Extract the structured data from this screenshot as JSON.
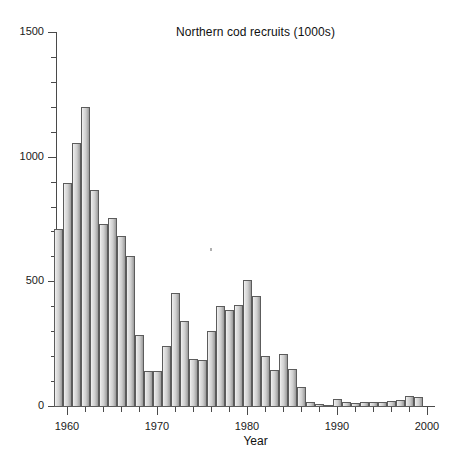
{
  "chart_data": {
    "type": "bar",
    "title": "Northern cod recruits (1000s)",
    "xlabel": "Year",
    "ylabel": "",
    "xlim": [
      1958.5,
      2000.5
    ],
    "ylim": [
      0,
      1500
    ],
    "grid": false,
    "legend": null,
    "y_ticks": [
      0,
      500,
      1000,
      1500
    ],
    "y_tick_labels": [
      "0",
      "500",
      "1000",
      "1500"
    ],
    "y_minor_tick_interval": 100,
    "x_ticks": [
      1960,
      1970,
      1980,
      1990,
      2000
    ],
    "x_tick_labels": [
      "1960",
      "1970",
      "1980",
      "1990",
      "2000"
    ],
    "x_minor_tick_interval": 2,
    "bar_color": "#cfcfcf",
    "bar_edge_color": "#5c5c5c",
    "categories": [
      1959,
      1960,
      1961,
      1962,
      1963,
      1964,
      1965,
      1966,
      1967,
      1968,
      1969,
      1970,
      1971,
      1972,
      1973,
      1974,
      1975,
      1976,
      1977,
      1978,
      1979,
      1980,
      1981,
      1982,
      1983,
      1984,
      1985,
      1986,
      1987,
      1988,
      1989,
      1990,
      1991,
      1992,
      1993,
      1994,
      1995,
      1996,
      1997,
      1998,
      1999
    ],
    "values": [
      710,
      895,
      1055,
      1200,
      865,
      730,
      755,
      680,
      600,
      285,
      140,
      140,
      240,
      455,
      340,
      190,
      185,
      300,
      400,
      385,
      405,
      505,
      440,
      200,
      145,
      210,
      150,
      75,
      15,
      8,
      5,
      30,
      15,
      12,
      15,
      18,
      15,
      20,
      25,
      40,
      35
    ]
  },
  "axes": {
    "y_axis_name": "recruits-axis",
    "x_axis_name": "year-axis"
  }
}
